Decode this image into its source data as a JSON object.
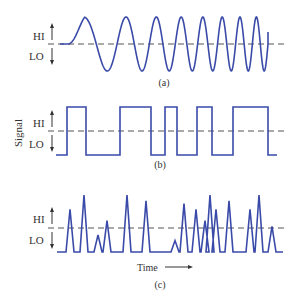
{
  "figure": {
    "y_axis_label": "Signal",
    "x_axis_label": "Time",
    "colors": {
      "signal": "#3a4aa8",
      "reference": "#555555",
      "text": "#333333"
    },
    "panels": [
      {
        "id": "a",
        "caption": "(a)",
        "hi_label": "HI",
        "lo_label": "LO",
        "signal_type": "analog sine wave of increasing frequency (chirp)",
        "cycles_shown": 8
      },
      {
        "id": "b",
        "caption": "(b)",
        "hi_label": "HI",
        "lo_label": "LO",
        "signal_type": "digital square wave",
        "levels": [
          "LO",
          "HI",
          "LO",
          "HI",
          "LO",
          "HI",
          "LO",
          "HI",
          "LO",
          "HI",
          "LO"
        ],
        "durations": [
          11,
          19,
          34,
          31,
          14,
          12,
          20,
          15,
          21,
          35,
          9
        ]
      },
      {
        "id": "c",
        "caption": "(c)",
        "hi_label": "HI",
        "lo_label": "LO",
        "signal_type": "pulse spikes",
        "spike_heights": [
          0.75,
          1.0,
          0.3,
          0.55,
          1.0,
          0.9,
          0.2,
          0.85,
          0.75,
          0.55,
          1.0,
          0.75,
          0.9,
          0.75,
          1.0,
          0.45
        ]
      }
    ]
  }
}
